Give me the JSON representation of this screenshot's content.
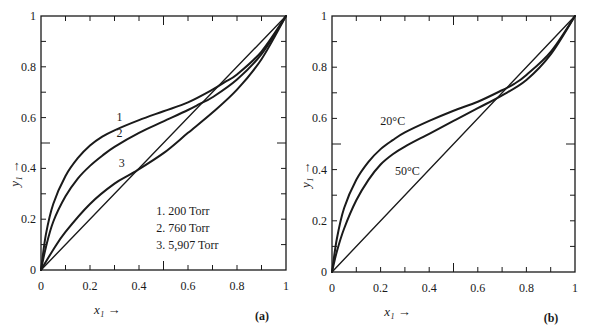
{
  "chart_data": [
    {
      "panel": "(a)",
      "type": "line",
      "xlabel": "x₁ →",
      "ylabel": "y₁ →",
      "xlim": [
        0,
        1
      ],
      "ylim": [
        0,
        1
      ],
      "xticks": [
        "0",
        "0.2",
        "0.4",
        "0.6",
        "0.8",
        "1"
      ],
      "yticks": [
        "0",
        "0.2",
        "0.4",
        "0.6",
        "0.8",
        "1"
      ],
      "grid": false,
      "legend": [
        "1.  200 Torr",
        "2.  760 Torr",
        "3.  5,907 Torr"
      ],
      "legend_position": "lower right",
      "series": [
        {
          "name": "1. 200 Torr",
          "label": "1",
          "x": [
            0,
            0.02,
            0.05,
            0.1,
            0.15,
            0.2,
            0.25,
            0.3,
            0.4,
            0.5,
            0.6,
            0.7,
            0.75,
            0.8,
            0.9,
            1.0
          ],
          "y": [
            0,
            0.14,
            0.26,
            0.37,
            0.44,
            0.49,
            0.525,
            0.55,
            0.59,
            0.625,
            0.66,
            0.71,
            0.74,
            0.77,
            0.86,
            1.0
          ]
        },
        {
          "name": "2. 760 Torr",
          "label": "2",
          "x": [
            0,
            0.02,
            0.05,
            0.1,
            0.15,
            0.2,
            0.25,
            0.3,
            0.4,
            0.5,
            0.6,
            0.65,
            0.7,
            0.8,
            0.9,
            1.0
          ],
          "y": [
            0,
            0.09,
            0.19,
            0.29,
            0.36,
            0.41,
            0.45,
            0.485,
            0.54,
            0.585,
            0.63,
            0.655,
            0.68,
            0.75,
            0.85,
            1.0
          ]
        },
        {
          "name": "3. 5,907 Torr",
          "label": "3",
          "x": [
            0,
            0.05,
            0.1,
            0.2,
            0.3,
            0.38,
            0.5,
            0.6,
            0.7,
            0.8,
            0.9,
            1.0
          ],
          "y": [
            0,
            0.08,
            0.15,
            0.26,
            0.34,
            0.385,
            0.46,
            0.54,
            0.62,
            0.71,
            0.83,
            1.0
          ]
        },
        {
          "name": "diagonal (y = x)",
          "x": [
            0,
            1
          ],
          "y": [
            0,
            1
          ]
        }
      ]
    },
    {
      "panel": "(b)",
      "type": "line",
      "xlabel": "x₁ →",
      "ylabel": "y₁ →",
      "xlim": [
        0,
        1
      ],
      "ylim": [
        0,
        1
      ],
      "xticks": [
        "0",
        "0.2",
        "0.4",
        "0.6",
        "0.8",
        "1"
      ],
      "yticks": [
        "0",
        "0.2",
        "0.4",
        "0.6",
        "0.8",
        "1"
      ],
      "grid": false,
      "series": [
        {
          "name": "20°C",
          "label": "20°C",
          "x": [
            0,
            0.02,
            0.05,
            0.1,
            0.15,
            0.2,
            0.25,
            0.3,
            0.4,
            0.5,
            0.6,
            0.7,
            0.75,
            0.8,
            0.9,
            1.0
          ],
          "y": [
            0,
            0.13,
            0.25,
            0.36,
            0.43,
            0.48,
            0.515,
            0.545,
            0.59,
            0.63,
            0.665,
            0.71,
            0.735,
            0.77,
            0.86,
            1.0
          ]
        },
        {
          "name": "50°C",
          "label": "50°C",
          "x": [
            0,
            0.02,
            0.05,
            0.1,
            0.15,
            0.2,
            0.25,
            0.3,
            0.4,
            0.5,
            0.6,
            0.7,
            0.8,
            0.9,
            1.0
          ],
          "y": [
            0,
            0.08,
            0.17,
            0.28,
            0.36,
            0.42,
            0.46,
            0.49,
            0.54,
            0.59,
            0.64,
            0.69,
            0.75,
            0.85,
            1.0
          ]
        },
        {
          "name": "diagonal (y = x)",
          "x": [
            0,
            1
          ],
          "y": [
            0,
            1
          ]
        }
      ]
    }
  ],
  "panels": {
    "a": {
      "label": "(a)",
      "xlabel": "x₁ →",
      "ylabel": "y₁ →",
      "curve_labels": [
        "1",
        "2",
        "3"
      ],
      "legend": [
        "1.  200 Torr",
        "2.  760 Torr",
        "3.  5,907 Torr"
      ],
      "ticks": [
        "0",
        "0.2",
        "0.4",
        "0.6",
        "0.8",
        "1"
      ]
    },
    "b": {
      "label": "(b)",
      "xlabel": "x₁ →",
      "ylabel": "y₁ →",
      "curve_labels": [
        "20°C",
        "50°C"
      ],
      "ticks": [
        "0",
        "0.2",
        "0.4",
        "0.6",
        "0.8",
        "1"
      ]
    }
  },
  "colors": {
    "ink": "#1a1a1a",
    "background": "#ffffff"
  }
}
